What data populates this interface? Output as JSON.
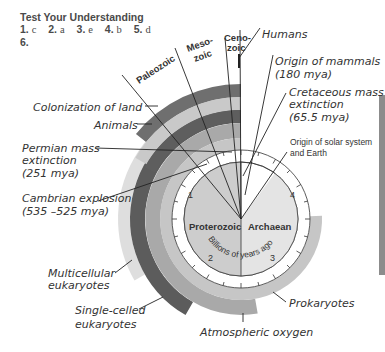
{
  "header": {
    "title": "Test Your Understanding",
    "answers": [
      {
        "num": "1.",
        "val": "c"
      },
      {
        "num": "2.",
        "val": "a"
      },
      {
        "num": "3.",
        "val": "e"
      },
      {
        "num": "4.",
        "val": "b"
      },
      {
        "num": "5.",
        "val": "d"
      }
    ],
    "answer6": "6."
  },
  "eras": {
    "paleozoic": "Paleozoic",
    "mesozoic_1": "Meso-",
    "mesozoic_2": "zoic",
    "cenozoic_1": "Ceno-",
    "cenozoic_2": "zoic"
  },
  "eons": {
    "proterozoic": "Proterozoic",
    "archaean": "Archaean"
  },
  "clock": {
    "axis_label": "Billions of years ago",
    "ticks": [
      "1",
      "2",
      "3",
      "4"
    ]
  },
  "labels": {
    "humans": "Humans",
    "mammals_1": "Origin of mammals",
    "mammals_2": "(180 mya)",
    "cretaceous_1": "Cretaceous mass",
    "cretaceous_2": "extinction",
    "cretaceous_3": "(65.5 mya)",
    "solar_1": "Origin of solar system",
    "solar_2": "and Earth",
    "land": "Colonization of land",
    "animals": "Animals",
    "permian_1": "Permian mass",
    "permian_2": "extinction",
    "permian_3": "(251 mya)",
    "cambrian_1": "Cambrian explosion",
    "cambrian_2": "(535 –525 mya)",
    "multicellular_1": "Multicellular",
    "multicellular_2": "eukaryotes",
    "single_1": "Single-celled",
    "single_2": "eukaryotes",
    "prokaryotes": "Prokaryotes",
    "oxygen": "Atmospheric oxygen"
  },
  "colors": {
    "pie": "#cfcfcf",
    "land": "#6e6e6e",
    "animals": "#bdbdbd",
    "animals_dark": "#5f5f5f",
    "multicellular": "#dcdcdc",
    "single_celled": "#5a5a5a",
    "oxygen": "#a8a8a8",
    "prokaryotes": "#c4c4c4"
  }
}
